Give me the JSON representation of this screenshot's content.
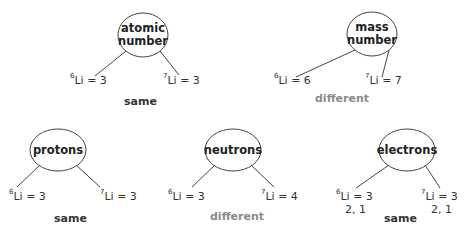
{
  "colors": {
    "line": "#444444",
    "same": "#333333",
    "different": "#8a8a8a"
  },
  "trees": [
    {
      "title": "atomic\nnumber",
      "title_line1": "atomic",
      "title_line2": "number",
      "left": {
        "iso": "6",
        "sym": "Li",
        "value": "= 3",
        "extra": ""
      },
      "right": {
        "iso": "7",
        "sym": "Li",
        "value": "= 3",
        "extra": ""
      },
      "verdict": "same"
    },
    {
      "title": "mass\nnumber",
      "title_line1": "mass",
      "title_line2": "number",
      "left": {
        "iso": "6",
        "sym": "Li",
        "value": "= 6",
        "extra": ""
      },
      "right": {
        "iso": "7",
        "sym": "Li",
        "value": "= 7",
        "extra": ""
      },
      "verdict": "different"
    },
    {
      "title": "protons",
      "title_line1": "protons",
      "title_line2": "",
      "left": {
        "iso": "6",
        "sym": "Li",
        "value": "= 3",
        "extra": ""
      },
      "right": {
        "iso": "7",
        "sym": "Li",
        "value": "= 3",
        "extra": ""
      },
      "verdict": "same"
    },
    {
      "title": "neutrons",
      "title_line1": "neutrons",
      "title_line2": "",
      "left": {
        "iso": "6",
        "sym": "Li",
        "value": "= 3",
        "extra": ""
      },
      "right": {
        "iso": "7",
        "sym": "Li",
        "value": "= 4",
        "extra": ""
      },
      "verdict": "different"
    },
    {
      "title": "electrons",
      "title_line1": "electrons",
      "title_line2": "",
      "left": {
        "iso": "6",
        "sym": "Li",
        "value": "= 3",
        "extra": "2, 1"
      },
      "right": {
        "iso": "7",
        "sym": "Li",
        "value": "= 3",
        "extra": "2, 1"
      },
      "verdict": "same"
    }
  ]
}
